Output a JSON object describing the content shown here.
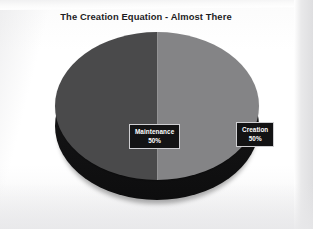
{
  "slide": {
    "title": "The Creation Equation - Almost There",
    "background_color": "#fdfdfd"
  },
  "chart_data": {
    "type": "pie",
    "title": "The Creation Equation - Almost There",
    "style": "3d-pie",
    "xlabel": "",
    "ylabel": "",
    "legend": "none",
    "grid": false,
    "categories": [
      "Maintenance",
      "Creation"
    ],
    "values": [
      50,
      50
    ],
    "value_unit": "%",
    "slices": [
      {
        "label": "Maintenance",
        "value": 50,
        "value_label": "50%",
        "color": "#4a4a4b",
        "position": "left"
      },
      {
        "label": "Creation",
        "value": 50,
        "value_label": "50%",
        "color": "#848486",
        "position": "right"
      }
    ],
    "side_color": "#141415",
    "label_text_color": "#ffffff",
    "label_background_color": "#131314",
    "label_border_color": "#cfcfd2"
  }
}
